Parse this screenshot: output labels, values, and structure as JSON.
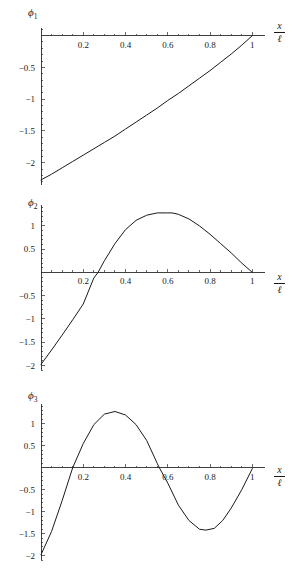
{
  "figure": {
    "background": "#ffffff",
    "curve_color": "#1a1a1a",
    "axis_color": "#2b2b2b"
  },
  "panels": [
    {
      "id": "phi1",
      "ylabel_symbol": "ϕ",
      "ylabel_sub": "1",
      "xlabel_num": "x",
      "xlabel_den": "ℓ"
    },
    {
      "id": "phi2",
      "ylabel_symbol": "ϕ",
      "ylabel_sub": "2",
      "xlabel_num": "x",
      "xlabel_den": "ℓ"
    },
    {
      "id": "phi3",
      "ylabel_symbol": "ϕ",
      "ylabel_sub": "3",
      "xlabel_num": "x",
      "xlabel_den": "ℓ"
    }
  ],
  "chart_data": [
    {
      "type": "line",
      "id": "phi1",
      "title": "",
      "xlabel": "x/ℓ",
      "ylabel": "ϕ1",
      "xlim": [
        0,
        1.06
      ],
      "ylim": [
        -2.35,
        0.12
      ],
      "grid": false,
      "legend": false,
      "xticks": [
        0.2,
        0.4,
        0.6,
        0.8,
        1
      ],
      "xticklabels": [
        "0.2",
        "0.4",
        "0.6",
        "0.8",
        "1"
      ],
      "yticks": [
        -0.5,
        -1,
        -1.5,
        -2
      ],
      "yticklabels": [
        "-0.5",
        "-1",
        "-1.5",
        "-2"
      ],
      "x": [
        0,
        0.05,
        0.1,
        0.15,
        0.2,
        0.25,
        0.3,
        0.35,
        0.4,
        0.45,
        0.5,
        0.55,
        0.6,
        0.65,
        0.7,
        0.75,
        0.8,
        0.85,
        0.9,
        0.95,
        1
      ],
      "y": [
        -2.27,
        -2.18,
        -2.08,
        -1.98,
        -1.88,
        -1.78,
        -1.68,
        -1.58,
        -1.47,
        -1.36,
        -1.25,
        -1.14,
        -1.02,
        -0.91,
        -0.79,
        -0.67,
        -0.55,
        -0.42,
        -0.29,
        -0.15,
        0.0
      ]
    },
    {
      "type": "line",
      "id": "phi2",
      "title": "",
      "xlabel": "x/ℓ",
      "ylabel": "ϕ2",
      "xlim": [
        0,
        1.06
      ],
      "ylim": [
        -2.1,
        1.45
      ],
      "grid": false,
      "legend": false,
      "xticks": [
        0.2,
        0.4,
        0.6,
        0.8,
        1
      ],
      "xticklabels": [
        "0.2",
        "0.4",
        "0.6",
        "0.8",
        "1"
      ],
      "yticks": [
        1,
        0.5,
        -0.5,
        -1,
        -1.5,
        -2
      ],
      "yticklabels": [
        "1",
        "0.5",
        "-0.5",
        "-1",
        "-1.5",
        "-2"
      ],
      "x": [
        0,
        0.05,
        0.1,
        0.15,
        0.2,
        0.25,
        0.27,
        0.3,
        0.35,
        0.4,
        0.45,
        0.5,
        0.55,
        0.6,
        0.62,
        0.65,
        0.7,
        0.75,
        0.8,
        0.85,
        0.9,
        0.95,
        1
      ],
      "y": [
        -1.98,
        -1.67,
        -1.35,
        -1.02,
        -0.68,
        -0.12,
        0.0,
        0.25,
        0.62,
        0.92,
        1.12,
        1.23,
        1.28,
        1.28,
        1.28,
        1.25,
        1.15,
        1.0,
        0.82,
        0.62,
        0.42,
        0.2,
        0.0
      ]
    },
    {
      "type": "line",
      "id": "phi3",
      "title": "",
      "xlabel": "x/ℓ",
      "ylabel": "ϕ3",
      "xlim": [
        0,
        1.06
      ],
      "ylim": [
        -2.1,
        1.45
      ],
      "grid": false,
      "legend": false,
      "xticks": [
        0.2,
        0.4,
        0.6,
        0.8,
        1
      ],
      "xticklabels": [
        "0.2",
        "0.4",
        "0.6",
        "0.8",
        "1"
      ],
      "yticks": [
        1,
        0.5,
        -0.5,
        -1,
        -1.5,
        -2
      ],
      "yticklabels": [
        "1",
        "0.5",
        "-0.5",
        "-1",
        "-1.5",
        "-2"
      ],
      "x": [
        0,
        0.05,
        0.1,
        0.15,
        0.2,
        0.25,
        0.3,
        0.35,
        0.4,
        0.45,
        0.5,
        0.55,
        0.56,
        0.6,
        0.65,
        0.7,
        0.75,
        0.78,
        0.82,
        0.86,
        0.9,
        0.95,
        1
      ],
      "y": [
        -1.98,
        -1.45,
        -0.75,
        0.0,
        0.55,
        0.98,
        1.22,
        1.28,
        1.2,
        0.98,
        0.62,
        0.1,
        0.0,
        -0.35,
        -0.85,
        -1.2,
        -1.4,
        -1.42,
        -1.38,
        -1.2,
        -0.92,
        -0.5,
        -0.02
      ]
    }
  ]
}
